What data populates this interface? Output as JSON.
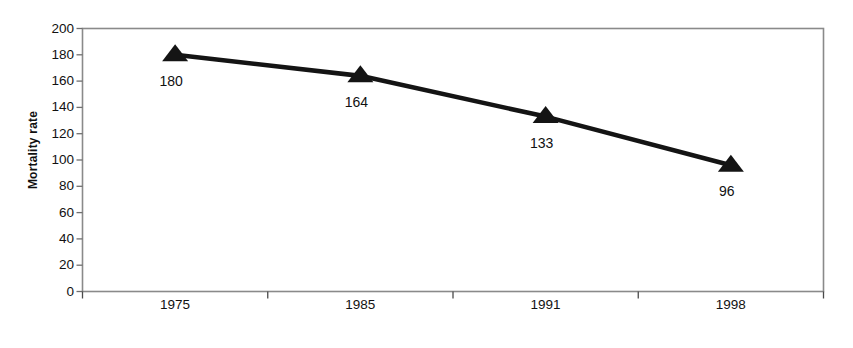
{
  "chart_data": {
    "type": "line",
    "title": "",
    "xlabel": "Year",
    "ylabel": "Mortality rate",
    "categories": [
      "1975",
      "1985",
      "1991",
      "1998"
    ],
    "values": [
      180,
      164,
      133,
      96
    ],
    "point_labels": [
      "180",
      "164",
      "133",
      "96"
    ],
    "series": [
      {
        "name": "Mortality rate",
        "values": [
          180,
          164,
          133,
          96
        ],
        "marker": "triangle-filled",
        "color": "#111111"
      }
    ],
    "ylim": [
      0,
      200
    ],
    "ytick_step": 20,
    "yticks": [
      0,
      20,
      40,
      60,
      80,
      100,
      120,
      140,
      160,
      180,
      200
    ],
    "ytick_labels": [
      "0",
      "20",
      "40",
      "60",
      "80",
      "100",
      "120",
      "140",
      "160",
      "180",
      "200"
    ],
    "xticks": [
      "1975",
      "1985",
      "1991",
      "1998"
    ],
    "grid": false,
    "legend": "none",
    "plot_border_color": "#808080",
    "line_color": "#111111"
  }
}
